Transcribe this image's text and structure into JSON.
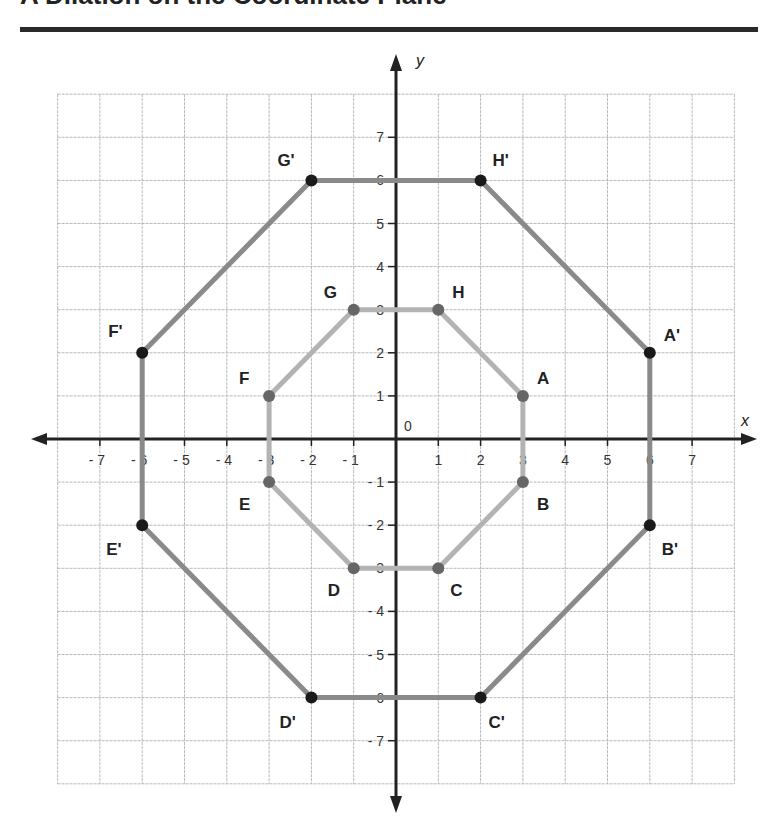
{
  "title": "A Dilation on the Coordinate Plane",
  "chart_data": {
    "type": "scatter",
    "title": "A Dilation on the Coordinate Plane",
    "xlabel": "x",
    "ylabel": "y",
    "origin_label": "0",
    "xlim": [
      -8,
      8
    ],
    "ylim": [
      -8,
      8
    ],
    "grid": true,
    "x_ticks": [
      -7,
      -6,
      -5,
      -4,
      -3,
      -2,
      -1,
      1,
      2,
      3,
      4,
      5,
      6,
      7
    ],
    "y_ticks": [
      -7,
      -6,
      -5,
      -4,
      -3,
      -2,
      -1,
      1,
      2,
      3,
      4,
      5,
      6,
      7
    ],
    "series": [
      {
        "name": "Original octagon",
        "closed": true,
        "line_color": "#b3b3b3",
        "point_color": "#666666",
        "points": [
          {
            "label": "A",
            "x": 3,
            "y": 1
          },
          {
            "label": "B",
            "x": 3,
            "y": -1
          },
          {
            "label": "C",
            "x": 1,
            "y": -3
          },
          {
            "label": "D",
            "x": -1,
            "y": -3
          },
          {
            "label": "E",
            "x": -3,
            "y": -1
          },
          {
            "label": "F",
            "x": -3,
            "y": 1
          },
          {
            "label": "G",
            "x": -1,
            "y": 3
          },
          {
            "label": "H",
            "x": 1,
            "y": 3
          }
        ]
      },
      {
        "name": "Dilated octagon (scale factor 2)",
        "closed": true,
        "line_color": "#8a8a8a",
        "point_color": "#1a1a1a",
        "points": [
          {
            "label": "A'",
            "x": 6,
            "y": 2
          },
          {
            "label": "B'",
            "x": 6,
            "y": -2
          },
          {
            "label": "C'",
            "x": 2,
            "y": -6
          },
          {
            "label": "D'",
            "x": -2,
            "y": -6
          },
          {
            "label": "E'",
            "x": -6,
            "y": -2
          },
          {
            "label": "F'",
            "x": -6,
            "y": 2
          },
          {
            "label": "G'",
            "x": -2,
            "y": 6
          },
          {
            "label": "H'",
            "x": 2,
            "y": 6
          }
        ]
      }
    ]
  }
}
